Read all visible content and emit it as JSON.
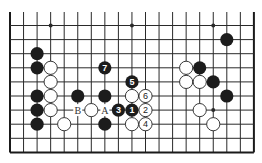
{
  "diagram": {
    "type": "go-board",
    "board_size": 19,
    "visible_rows": 10,
    "visible_cols": 19,
    "top_edge_open": true,
    "bottom_edge": true,
    "left_edge": true,
    "right_edge": true,
    "grid": {
      "x0": 10,
      "dx": 13.55,
      "y0": 25.5,
      "dy": 14.1,
      "top_line_y": 12
    },
    "star_points": [
      {
        "col": 3,
        "row": 0
      },
      {
        "col": 9,
        "row": 0
      },
      {
        "col": 15,
        "row": 0
      },
      {
        "col": 15,
        "row": 6
      }
    ],
    "stones": [
      {
        "col": 2,
        "row": 2,
        "color": "black"
      },
      {
        "col": 2,
        "row": 3,
        "color": "black"
      },
      {
        "col": 2,
        "row": 5,
        "color": "black"
      },
      {
        "col": 2,
        "row": 6,
        "color": "black"
      },
      {
        "col": 2,
        "row": 7,
        "color": "black"
      },
      {
        "col": 3,
        "row": 3,
        "color": "white"
      },
      {
        "col": 3,
        "row": 4,
        "color": "white"
      },
      {
        "col": 3,
        "row": 5,
        "color": "white"
      },
      {
        "col": 3,
        "row": 6,
        "color": "white"
      },
      {
        "col": 4,
        "row": 7,
        "color": "white"
      },
      {
        "col": 5,
        "row": 5,
        "color": "black"
      },
      {
        "col": 6,
        "row": 6,
        "color": "white"
      },
      {
        "col": 7,
        "row": 5,
        "color": "black"
      },
      {
        "col": 7,
        "row": 7,
        "color": "black"
      },
      {
        "col": 7,
        "row": 3,
        "color": "black",
        "label": "7"
      },
      {
        "col": 9,
        "row": 4,
        "color": "black",
        "label": "5"
      },
      {
        "col": 9,
        "row": 5,
        "color": "white"
      },
      {
        "col": 10,
        "row": 5,
        "color": "white",
        "label": "6"
      },
      {
        "col": 8,
        "row": 6,
        "color": "black",
        "label": "3"
      },
      {
        "col": 9,
        "row": 6,
        "color": "black",
        "label": "1"
      },
      {
        "col": 10,
        "row": 6,
        "color": "white",
        "label": "2"
      },
      {
        "col": 9,
        "row": 7,
        "color": "white"
      },
      {
        "col": 10,
        "row": 7,
        "color": "white",
        "label": "4"
      },
      {
        "col": 13,
        "row": 3,
        "color": "white"
      },
      {
        "col": 14,
        "row": 3,
        "color": "black"
      },
      {
        "col": 13,
        "row": 4,
        "color": "white"
      },
      {
        "col": 14,
        "row": 4,
        "color": "white"
      },
      {
        "col": 15,
        "row": 4,
        "color": "black"
      },
      {
        "col": 16,
        "row": 1,
        "color": "black"
      },
      {
        "col": 16,
        "row": 5,
        "color": "black"
      },
      {
        "col": 14,
        "row": 6,
        "color": "white"
      },
      {
        "col": 15,
        "row": 7,
        "color": "white"
      }
    ],
    "markers": [
      {
        "col": 5,
        "row": 6,
        "text": "B"
      },
      {
        "col": 7,
        "row": 6,
        "text": "A"
      }
    ],
    "colors": {
      "line": "#2a2a2a",
      "black_stone": "#1c1c1c",
      "white_stone": "#ffffff",
      "background": "#ffffff"
    }
  }
}
